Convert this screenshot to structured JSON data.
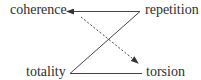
{
  "diagram": {
    "nodes": [
      {
        "id": "coherence",
        "label": "coherence"
      },
      {
        "id": "repetition",
        "label": "repetition"
      },
      {
        "id": "totality",
        "label": "totality"
      },
      {
        "id": "torsion",
        "label": "torsion"
      }
    ],
    "edges": [
      {
        "from": "repetition",
        "to": "coherence",
        "style": "solid",
        "arrow": true
      },
      {
        "from": "repetition",
        "to": "totality",
        "style": "solid",
        "arrow": false
      },
      {
        "from": "totality",
        "to": "torsion",
        "style": "solid",
        "arrow": false
      },
      {
        "from": "coherence",
        "to": "torsion",
        "style": "dashed",
        "arrow": true
      }
    ],
    "colors": {
      "text": "#2e2e2e",
      "line": "#444444",
      "background": "#ffffff"
    }
  }
}
